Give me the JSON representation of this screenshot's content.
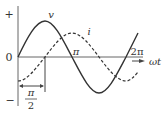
{
  "diagram": {
    "title": "",
    "axes": {
      "y_plus": "+",
      "y_minus": "−",
      "origin": "0",
      "x_label": "ωt",
      "tick_pi": "π",
      "tick_2pi": "2π"
    },
    "curves": [
      {
        "name": "v",
        "label": "v",
        "style": "solid",
        "amplitude": 1.0,
        "phase_deg": 0
      },
      {
        "name": "i",
        "label": "i",
        "style": "dashed",
        "amplitude": 0.67,
        "phase_deg": -90
      }
    ],
    "phase_annotation": {
      "numerator": "π",
      "denominator": "2"
    },
    "colors": {
      "line": "#333333",
      "background": "#ffffff"
    }
  }
}
